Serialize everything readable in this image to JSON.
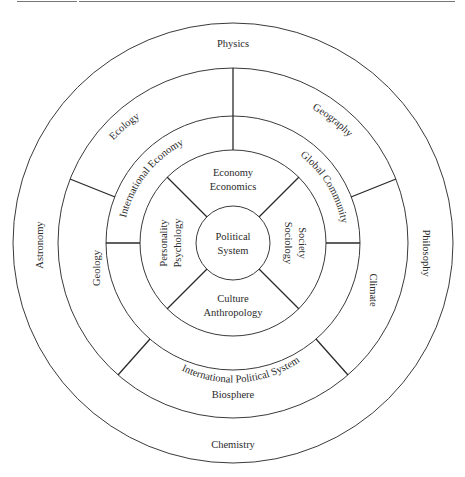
{
  "diagram": {
    "center": {
      "line1": "Political",
      "line2": "System"
    },
    "ring_social": {
      "top": {
        "line1": "Economy",
        "line2": "Economics"
      },
      "right": {
        "line1": "Society",
        "line2": "Sociology"
      },
      "bottom": {
        "line1": "Culture",
        "line2": "Anthropology"
      },
      "left": {
        "line1": "Personality",
        "line2": "Psychology"
      }
    },
    "ring_international": {
      "upper_left": "International Economy",
      "upper_right": "Global Community",
      "bottom": "International Political System"
    },
    "ring_natural": {
      "upper_left": "Ecology",
      "upper_right": "Geography",
      "left": "Geology",
      "right": "Climate",
      "bottom": "Biosphere"
    },
    "ring_sciences": {
      "top": "Physics",
      "left": "Astronomy",
      "right": "Philosophy",
      "bottom": "Chemistry"
    },
    "colors": {
      "line": "#3a3a3a",
      "text": "#2a2a2a",
      "background": "#ffffff"
    }
  }
}
